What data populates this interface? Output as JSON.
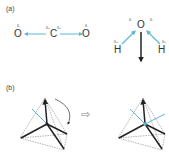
{
  "panel_a": {
    "label": "(a)",
    "co2": {
      "atoms": [
        "O",
        "C",
        "O"
      ],
      "charges": {
        "o_left": "δ-",
        "c_left": "δ+",
        "c_right": "δ+",
        "o_right": "δ-"
      }
    },
    "h2o": {
      "atoms": {
        "o": "O",
        "h_left": "H",
        "h_right": "H"
      },
      "charges": {
        "o_left": "δ-",
        "o_right": "δ-",
        "h_left": "δ+",
        "h_right": "δ+"
      }
    }
  },
  "panel_b": {
    "label": "(b)",
    "arrow": "⇨"
  },
  "colors": {
    "dipole": "#5bb8d6",
    "bond": "#222222",
    "dashed": "#666666"
  }
}
